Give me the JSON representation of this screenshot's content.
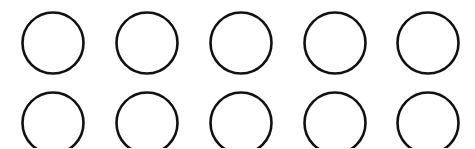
{
  "grid": {
    "rows": 2,
    "cols": 5,
    "stroke_color": "#111111",
    "fill_color": "#ffffff",
    "stroke_width": 2.6,
    "radius": 30.5,
    "col_centers": [
      53,
      147,
      241,
      335,
      428
    ],
    "row_centers": [
      43,
      123
    ],
    "shape": "circle-outline"
  }
}
